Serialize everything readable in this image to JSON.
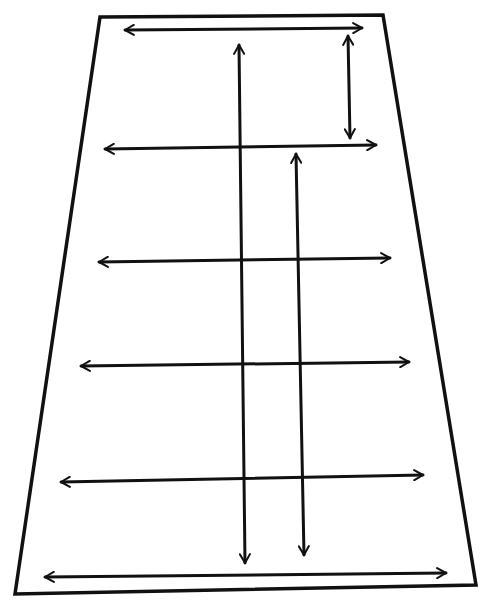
{
  "diagram": {
    "stroke_color": "#111111",
    "background": "#ffffff",
    "trapezoid": {
      "points": [
        [
          100,
          17
        ],
        [
          383,
          15
        ],
        [
          476,
          585
        ],
        [
          15,
          594
        ]
      ],
      "stroke_width": 3.5
    },
    "horizontal_arrows": [
      {
        "x1": 125,
        "y1": 30,
        "x2": 362,
        "y2": 28,
        "heads": "both"
      },
      {
        "x1": 105,
        "y1": 149,
        "x2": 376,
        "y2": 145,
        "heads": "both"
      },
      {
        "x1": 99,
        "y1": 262,
        "x2": 390,
        "y2": 258,
        "heads": "both"
      },
      {
        "x1": 81,
        "y1": 366,
        "x2": 409,
        "y2": 362,
        "heads": "both"
      },
      {
        "x1": 61,
        "y1": 482,
        "x2": 423,
        "y2": 475,
        "heads": "both"
      },
      {
        "x1": 45,
        "y1": 577,
        "x2": 446,
        "y2": 573,
        "heads": "both"
      }
    ],
    "vertical_arrows": [
      {
        "x1": 348,
        "y1": 36,
        "x2": 350,
        "y2": 138,
        "heads": "both"
      },
      {
        "x1": 239,
        "y1": 45,
        "x2": 245,
        "y2": 563,
        "heads": "both"
      },
      {
        "x1": 296,
        "y1": 154,
        "x2": 304,
        "y2": 555,
        "heads": "both"
      }
    ]
  }
}
